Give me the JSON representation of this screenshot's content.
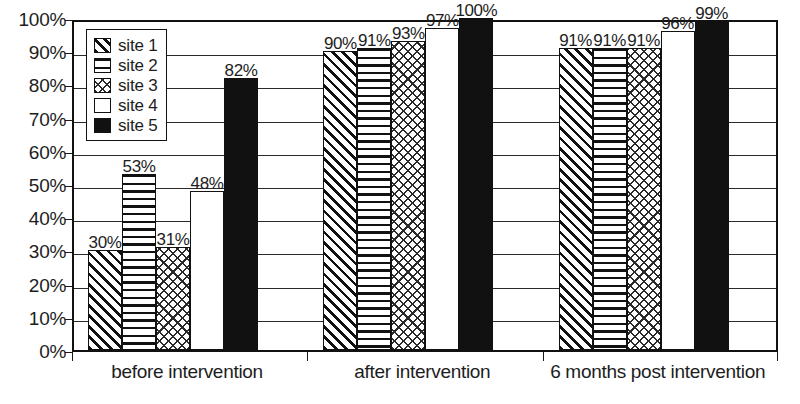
{
  "chart_data": {
    "type": "bar",
    "title": "",
    "subtitle": "",
    "xlabel": "",
    "ylabel": "",
    "ylim": [
      0,
      100
    ],
    "y_tick_labels": [
      "100%",
      "90%",
      "80%",
      "70%",
      "60%",
      "50%",
      "40%",
      "30%",
      "20%",
      "10%",
      "0%"
    ],
    "y_tick_values": [
      100,
      90,
      80,
      70,
      60,
      50,
      40,
      30,
      20,
      10,
      0
    ],
    "grid": true,
    "legend_position": "top-left-inside",
    "categories": [
      "before intervention",
      "after intervention",
      "6 months post intervention"
    ],
    "series": [
      {
        "name": "site 1",
        "pattern": "diagonal-hatch",
        "values": [
          30,
          90,
          91
        ],
        "labels": [
          "30%",
          "90%",
          "91%"
        ]
      },
      {
        "name": "site 2",
        "pattern": "horizontal-lines",
        "values": [
          53,
          91,
          91
        ],
        "labels": [
          "53%",
          "91%",
          "91%"
        ]
      },
      {
        "name": "site 3",
        "pattern": "cross-hatch",
        "values": [
          31,
          93,
          91
        ],
        "labels": [
          "31%",
          "93%",
          "91%"
        ]
      },
      {
        "name": "site 4",
        "pattern": "white-fill",
        "values": [
          48,
          97,
          96
        ],
        "labels": [
          "48%",
          "97%",
          "96%"
        ]
      },
      {
        "name": "site 5",
        "pattern": "solid-black",
        "values": [
          82,
          100,
          99
        ],
        "labels": [
          "82%",
          "100%",
          "99%"
        ]
      }
    ],
    "colors": {
      "axis": "#111111",
      "gridline": "#2b2b2b",
      "text": "#1d1d1d",
      "bar_outline": "#111111",
      "solid_fill": "#111111",
      "background": "#ffffff"
    }
  },
  "legend": {
    "items": [
      {
        "label": "site 1",
        "pattern": "diagonal-hatch"
      },
      {
        "label": "site 2",
        "pattern": "horizontal-lines"
      },
      {
        "label": "site 3",
        "pattern": "cross-hatch"
      },
      {
        "label": "site 4",
        "pattern": "white-fill"
      },
      {
        "label": "site 5",
        "pattern": "solid-black"
      }
    ]
  }
}
